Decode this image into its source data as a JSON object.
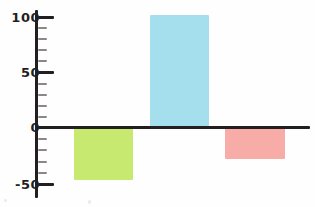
{
  "chart_data": {
    "type": "bar",
    "title": "",
    "subtitle": "",
    "xlabel": "",
    "ylabel": "",
    "categories": [
      "",
      "",
      ""
    ],
    "values": [
      -48,
      100,
      -29
    ],
    "colors": [
      "#c5e867",
      "#a0dcec",
      "#f7a8a3"
    ],
    "ylim": [
      -60,
      112
    ],
    "yticks_major": [
      100,
      50,
      0,
      -50
    ],
    "yticks_major_labels": [
      "100",
      "50",
      "0",
      "-50"
    ],
    "yticks_minor": [
      90,
      80,
      70,
      60,
      40,
      30,
      20,
      10,
      -10,
      -20,
      -30,
      -40
    ],
    "grid": false,
    "legend": false,
    "legend_position": "none",
    "axis_color": "#231f20",
    "background": "#fefefe",
    "series": [
      {
        "name": "series-1",
        "values": [
          -48,
          100,
          -29
        ]
      }
    ]
  },
  "axis": {
    "label_100": "100",
    "label_50": "50",
    "label_0": "0",
    "label_minus50": "-50"
  },
  "bars": [
    {
      "name": "bar-green",
      "value": -48,
      "color": "#c5e867"
    },
    {
      "name": "bar-blue",
      "value": 100,
      "color": "#a0dcec"
    },
    {
      "name": "bar-salmon",
      "value": -29,
      "color": "#f7a8a3"
    }
  ]
}
